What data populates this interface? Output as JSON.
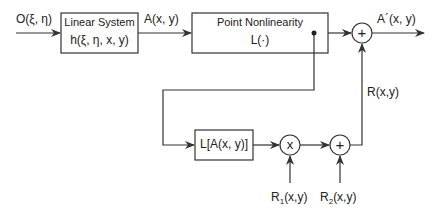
{
  "diagram": {
    "input_label": "O(ξ, η)",
    "linear_system": {
      "title": "Linear System",
      "subtitle": "h(ξ, η, x, y)"
    },
    "intermediate_label": "A(x, y)",
    "point_nonlinearity": {
      "title": "Point Nonlinearity",
      "subtitle": "L(·)"
    },
    "output_label": "A´(x, y)",
    "feedback_box": {
      "title": "L[A(x, y)]"
    },
    "multiply_symbol": "x",
    "sum_symbol": "+",
    "sum_bottom_symbol": "+",
    "r_label": "R(x,y)",
    "r1_label": {
      "base": "R",
      "sub": "1",
      "rest": "(x,y)"
    },
    "r2_label": {
      "base": "R",
      "sub": "2",
      "rest": "(x,y)"
    },
    "colors": {
      "line": "#333333",
      "background": "#ffffff"
    }
  }
}
